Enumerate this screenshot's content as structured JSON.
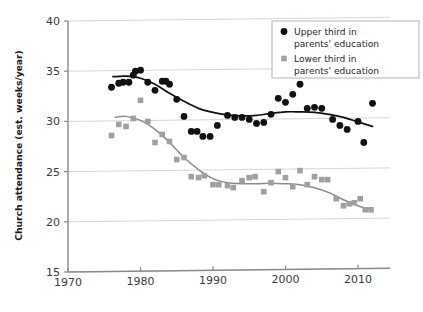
{
  "chart_data": {
    "type": "scatter",
    "title": "",
    "xlabel": "",
    "ylabel": "Church attendance (est. weeks/year)",
    "xlim": [
      1970,
      2015
    ],
    "ylim": [
      15,
      40
    ],
    "xticks": [
      1970,
      1980,
      1990,
      2000,
      2010
    ],
    "yticks": [
      15,
      20,
      25,
      30,
      35,
      40
    ],
    "grid": true,
    "grid_axis": "y",
    "legend_position": "top-right",
    "series": [
      {
        "name": "Upper third in parents' education",
        "marker": "circle",
        "color": "#111111",
        "trend_color": "#111111",
        "points": [
          {
            "x": 1976,
            "y": 33.4
          },
          {
            "x": 1977,
            "y": 33.8
          },
          {
            "x": 1977.6,
            "y": 33.9
          },
          {
            "x": 1978.4,
            "y": 33.9
          },
          {
            "x": 1979,
            "y": 34.6
          },
          {
            "x": 1979.3,
            "y": 35.0
          },
          {
            "x": 1980,
            "y": 35.1
          },
          {
            "x": 1981,
            "y": 33.9
          },
          {
            "x": 1982,
            "y": 33.1
          },
          {
            "x": 1983,
            "y": 34.0
          },
          {
            "x": 1983.5,
            "y": 34.0
          },
          {
            "x": 1984,
            "y": 33.7
          },
          {
            "x": 1985,
            "y": 32.2
          },
          {
            "x": 1986,
            "y": 30.5
          },
          {
            "x": 1987,
            "y": 29.0
          },
          {
            "x": 1987.8,
            "y": 29.0
          },
          {
            "x": 1988.6,
            "y": 28.5
          },
          {
            "x": 1989.6,
            "y": 28.5
          },
          {
            "x": 1990.6,
            "y": 29.6
          },
          {
            "x": 1992,
            "y": 30.6
          },
          {
            "x": 1993,
            "y": 30.4
          },
          {
            "x": 1994,
            "y": 30.4
          },
          {
            "x": 1995,
            "y": 30.2
          },
          {
            "x": 1996,
            "y": 29.8
          },
          {
            "x": 1997,
            "y": 29.9
          },
          {
            "x": 1998,
            "y": 30.7
          },
          {
            "x": 1999,
            "y": 32.3
          },
          {
            "x": 2000,
            "y": 31.9
          },
          {
            "x": 2001,
            "y": 32.7
          },
          {
            "x": 2002,
            "y": 33.7
          },
          {
            "x": 2003,
            "y": 31.3
          },
          {
            "x": 2004,
            "y": 31.4
          },
          {
            "x": 2005,
            "y": 31.3
          },
          {
            "x": 2006.5,
            "y": 30.2
          },
          {
            "x": 2007.5,
            "y": 29.6
          },
          {
            "x": 2008.5,
            "y": 29.2
          },
          {
            "x": 2010,
            "y": 30.0
          },
          {
            "x": 2010.8,
            "y": 27.9
          },
          {
            "x": 2012,
            "y": 31.8
          }
        ],
        "trend": [
          {
            "x": 1976.2,
            "y": 34.45
          },
          {
            "x": 1978,
            "y": 34.5
          },
          {
            "x": 1980,
            "y": 34.3
          },
          {
            "x": 1982,
            "y": 33.7
          },
          {
            "x": 1984,
            "y": 32.8
          },
          {
            "x": 1986,
            "y": 32.0
          },
          {
            "x": 1988,
            "y": 31.3
          },
          {
            "x": 1990,
            "y": 30.9
          },
          {
            "x": 1992,
            "y": 30.65
          },
          {
            "x": 1994,
            "y": 30.55
          },
          {
            "x": 1996,
            "y": 30.6
          },
          {
            "x": 1998,
            "y": 30.8
          },
          {
            "x": 2000,
            "y": 30.95
          },
          {
            "x": 2002,
            "y": 30.95
          },
          {
            "x": 2004,
            "y": 30.9
          },
          {
            "x": 2006,
            "y": 30.7
          },
          {
            "x": 2008,
            "y": 30.4
          },
          {
            "x": 2010,
            "y": 29.95
          },
          {
            "x": 2012,
            "y": 29.5
          }
        ]
      },
      {
        "name": "Lower third in parents' education",
        "marker": "square",
        "color": "#a0a0a0",
        "trend_color": "#8c8c8c",
        "points": [
          {
            "x": 1976,
            "y": 28.6
          },
          {
            "x": 1977,
            "y": 29.7
          },
          {
            "x": 1978,
            "y": 29.5
          },
          {
            "x": 1979,
            "y": 30.3
          },
          {
            "x": 1980,
            "y": 32.1
          },
          {
            "x": 1981,
            "y": 30.0
          },
          {
            "x": 1982,
            "y": 27.9
          },
          {
            "x": 1983,
            "y": 28.7
          },
          {
            "x": 1984,
            "y": 28.0
          },
          {
            "x": 1985,
            "y": 26.2
          },
          {
            "x": 1986,
            "y": 26.4
          },
          {
            "x": 1987,
            "y": 24.5
          },
          {
            "x": 1988,
            "y": 24.4
          },
          {
            "x": 1988.8,
            "y": 24.6
          },
          {
            "x": 1990,
            "y": 23.7
          },
          {
            "x": 1990.8,
            "y": 23.7
          },
          {
            "x": 1992,
            "y": 23.6
          },
          {
            "x": 1992.8,
            "y": 23.4
          },
          {
            "x": 1994,
            "y": 24.1
          },
          {
            "x": 1995,
            "y": 24.4
          },
          {
            "x": 1995.8,
            "y": 24.5
          },
          {
            "x": 1997,
            "y": 23.0
          },
          {
            "x": 1998,
            "y": 23.9
          },
          {
            "x": 1999,
            "y": 25.0
          },
          {
            "x": 2000,
            "y": 24.4
          },
          {
            "x": 2001,
            "y": 23.5
          },
          {
            "x": 2002,
            "y": 25.1
          },
          {
            "x": 2003,
            "y": 23.7
          },
          {
            "x": 2004,
            "y": 24.5
          },
          {
            "x": 2005,
            "y": 24.2
          },
          {
            "x": 2005.8,
            "y": 24.2
          },
          {
            "x": 2007,
            "y": 22.3
          },
          {
            "x": 2008,
            "y": 21.6
          },
          {
            "x": 2008.8,
            "y": 21.8
          },
          {
            "x": 2009.5,
            "y": 21.9
          },
          {
            "x": 2010.3,
            "y": 22.3
          },
          {
            "x": 2011,
            "y": 21.2
          },
          {
            "x": 2011.8,
            "y": 21.2
          }
        ],
        "trend": [
          {
            "x": 1976.5,
            "y": 30.4
          },
          {
            "x": 1978,
            "y": 30.5
          },
          {
            "x": 1980,
            "y": 30.1
          },
          {
            "x": 1982,
            "y": 29.2
          },
          {
            "x": 1984,
            "y": 27.9
          },
          {
            "x": 1986,
            "y": 26.4
          },
          {
            "x": 1988,
            "y": 25.2
          },
          {
            "x": 1990,
            "y": 24.3
          },
          {
            "x": 1992,
            "y": 23.9
          },
          {
            "x": 1994,
            "y": 23.8
          },
          {
            "x": 1996,
            "y": 23.8
          },
          {
            "x": 1998,
            "y": 23.85
          },
          {
            "x": 2000,
            "y": 23.8
          },
          {
            "x": 2002,
            "y": 23.7
          },
          {
            "x": 2004,
            "y": 23.4
          },
          {
            "x": 2006,
            "y": 22.9
          },
          {
            "x": 2008,
            "y": 22.2
          },
          {
            "x": 2010,
            "y": 21.6
          },
          {
            "x": 2011.8,
            "y": 21.2
          }
        ]
      }
    ]
  },
  "legend": {
    "entries": [
      {
        "label_line1": "Upper third in",
        "label_line2": "parents' education",
        "marker": "circle"
      },
      {
        "label_line1": "Lower third in",
        "label_line2": "parents' education",
        "marker": "square"
      }
    ]
  },
  "colors": {
    "upper_marker": "#111111",
    "lower_marker": "#a0a0a0",
    "grid": "#d6d6d6",
    "axis": "#8a8a8a",
    "text": "#1f1f1f"
  }
}
